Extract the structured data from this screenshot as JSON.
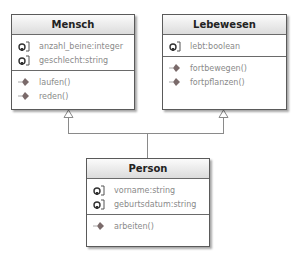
{
  "classes": {
    "mensch": {
      "name": "Mensch",
      "attributes": [
        {
          "icon": "attribute-icon",
          "text": "anzahl_beine:integer"
        },
        {
          "icon": "attribute-icon",
          "text": "geschlecht:string"
        }
      ],
      "operations": [
        {
          "icon": "operation-icon",
          "text": "laufen()"
        },
        {
          "icon": "operation-icon",
          "text": "reden()"
        }
      ]
    },
    "lebewesen": {
      "name": "Lebewesen",
      "attributes": [
        {
          "icon": "attribute-icon",
          "text": "lebt:boolean"
        }
      ],
      "operations": [
        {
          "icon": "operation-icon",
          "text": "fortbewegen()"
        },
        {
          "icon": "operation-icon",
          "text": "fortpflanzen()"
        }
      ]
    },
    "person": {
      "name": "Person",
      "attributes": [
        {
          "icon": "attribute-icon",
          "text": "vorname:string"
        },
        {
          "icon": "attribute-icon",
          "text": "geburtsdatum:string"
        }
      ],
      "operations": [
        {
          "icon": "operation-icon",
          "text": "arbeiten()"
        }
      ]
    }
  },
  "relations": [
    {
      "type": "generalization",
      "from": "Person",
      "to": "Mensch"
    },
    {
      "type": "generalization",
      "from": "Person",
      "to": "Lebewesen"
    }
  ],
  "colors": {
    "border": "#5a5a5a",
    "text": "#8a8a8a",
    "header_top": "#fbfbfb",
    "header_bottom": "#dcdcdc",
    "line": "#8a8a8a"
  }
}
